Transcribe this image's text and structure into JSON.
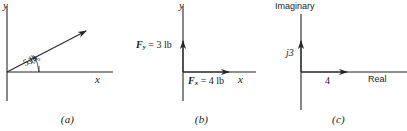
{
  "figure": {
    "panels": [
      {
        "id": "a",
        "caption": "(a)",
        "axis_y_label": "y",
        "axis_x_label": "x",
        "vector_label": "5 lb",
        "angle_label": "37°",
        "vector_magnitude": 5,
        "vector_angle_deg": 37,
        "units": "lb"
      },
      {
        "id": "b",
        "caption": "(b)",
        "axis_y_label": "y",
        "axis_x_label": "x",
        "y_component_label_prefix": "F",
        "y_component_label_sub": "y",
        "y_component_label_value": " = 3 lb",
        "x_component_label_prefix": "F",
        "x_component_label_sub": "x",
        "x_component_label_value": " = 4 lb",
        "y_component": 3,
        "x_component": 4,
        "units": "lb"
      },
      {
        "id": "c",
        "caption": "(c)",
        "axis_y_label": "Imaginary",
        "axis_x_label": "Real",
        "imaginary_label": "j3",
        "real_label": "4",
        "imaginary_value": 3,
        "real_value": 4
      }
    ]
  },
  "style": {
    "line_color": "#262626",
    "text_color": "#1a1a1a",
    "background": "#ffffff"
  }
}
